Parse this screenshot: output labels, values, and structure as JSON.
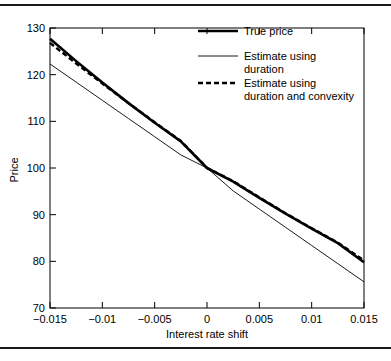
{
  "figure": {
    "background_color": "#ffffff",
    "rule_color": "#1a1a1a",
    "has_top_rule": true,
    "has_bottom_rule": true
  },
  "chart_data": {
    "type": "line",
    "title": "",
    "xlabel": "Interest rate shift",
    "ylabel": "Price",
    "xlim": [
      -0.015,
      0.015
    ],
    "ylim": [
      70,
      130
    ],
    "grid": false,
    "legend_position": "top-right",
    "xticks": [
      -0.015,
      -0.01,
      -0.005,
      0,
      0.005,
      0.01,
      0.015
    ],
    "xticklabels": [
      "−0.015",
      "−0.01",
      "−0.005",
      "0",
      "0.005",
      "0.01",
      "0.015"
    ],
    "yticks": [
      70,
      80,
      90,
      100,
      110,
      120,
      130
    ],
    "yticklabels": [
      "70",
      "80",
      "90",
      "100",
      "110",
      "120",
      "130"
    ],
    "x": [
      -0.015,
      -0.0125,
      -0.01,
      -0.0075,
      -0.005,
      -0.0025,
      0,
      0.0025,
      0.005,
      0.0075,
      0.01,
      0.0125,
      0.015
    ],
    "series": [
      {
        "name": "True price",
        "style": "solid",
        "width": 2.6,
        "color": "#000000",
        "values": [
          127.7,
          122.9,
          118.3,
          113.9,
          109.7,
          105.7,
          100.0,
          97.1,
          93.6,
          90.2,
          87.0,
          83.9,
          79.8
        ]
      },
      {
        "name": "Estimate using duration",
        "style": "solid",
        "width": 0.9,
        "color": "#000000",
        "values": [
          122.3,
          118.4,
          114.5,
          110.6,
          106.7,
          102.8,
          100.0,
          95.1,
          91.2,
          87.3,
          83.4,
          79.5,
          75.6
        ]
      },
      {
        "name": "Estimate using duration and convexity",
        "style": "dashed",
        "width": 2.4,
        "color": "#000000",
        "values": [
          126.8,
          122.4,
          118.1,
          113.9,
          109.8,
          105.8,
          100.0,
          97.2,
          93.7,
          90.3,
          87.1,
          84.0,
          80.2
        ]
      }
    ],
    "legend": [
      {
        "label": "True price",
        "style": "thick-solid"
      },
      {
        "label": "Estimate using",
        "label2": "duration",
        "style": "thin-solid"
      },
      {
        "label": "Estimate using",
        "label2": "duration and convexity",
        "style": "dashed"
      }
    ]
  }
}
